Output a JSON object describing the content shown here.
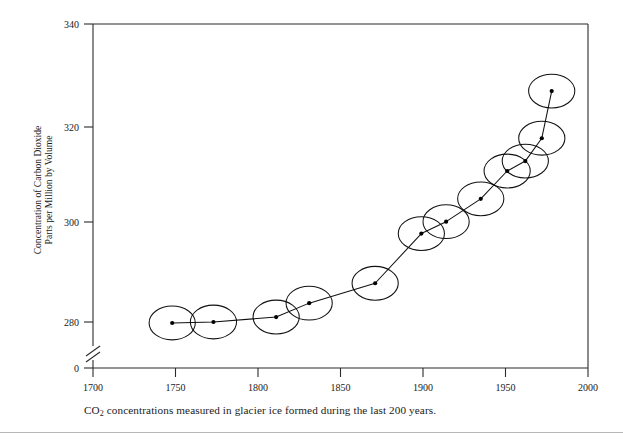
{
  "figure": {
    "caption_prefix": "CO",
    "caption_sub": "2",
    "caption_rest": " concentrations measured in glacier ice formed during the last 200 years."
  },
  "chart_data": {
    "type": "scatter",
    "title": "",
    "subtitle": "",
    "xlabel": "",
    "ylabel": "Concentration of Carbon Dioxide Parts per Million by Volume",
    "ylabel_line1": "Concentration of Carbon Dioxide",
    "ylabel_line2": "Parts per Million by Volume",
    "x": [
      1748,
      1773,
      1811,
      1831,
      1871,
      1899,
      1914,
      1935,
      1951,
      1962,
      1972,
      1978
    ],
    "values": [
      279.8,
      280.0,
      281.0,
      283.8,
      287.8,
      297.8,
      300.2,
      304.8,
      310.4,
      312.4,
      317.0,
      326.5
    ],
    "series": [
      {
        "name": "CO2 concentration in glacier ice",
        "x": [
          1748,
          1773,
          1811,
          1831,
          1871,
          1899,
          1914,
          1935,
          1951,
          1962,
          1972,
          1978
        ],
        "values": [
          279.8,
          280.0,
          281.0,
          283.8,
          287.8,
          297.8,
          300.2,
          304.8,
          310.4,
          312.4,
          317.0,
          326.5
        ]
      }
    ],
    "uncertainty_ellipses": {
      "x_halfwidth_years": 14,
      "y_halfheight_ppm": 3.4,
      "note": "each data point is enclosed in an open uncertainty ellipse"
    },
    "xlim": [
      1700,
      2000
    ],
    "ylim": [
      275,
      340
    ],
    "xticks": [
      1700,
      1750,
      1800,
      1850,
      1900,
      1950,
      2000
    ],
    "xticklabels": [
      "1700",
      "1750",
      "1800",
      "1850",
      "1900",
      "1950",
      "2000"
    ],
    "yticks": [
      280,
      300,
      320,
      340
    ],
    "yticklabels": [
      "280",
      "300",
      "320",
      "340"
    ],
    "y_origin_label": "0",
    "y_axis_break": true,
    "grid": false,
    "legend": "none",
    "line_connecting_points": true,
    "marker": "filled-circle",
    "line_color": "#111111",
    "marker_color": "#000000",
    "axis_color": "#2b2b2b"
  }
}
